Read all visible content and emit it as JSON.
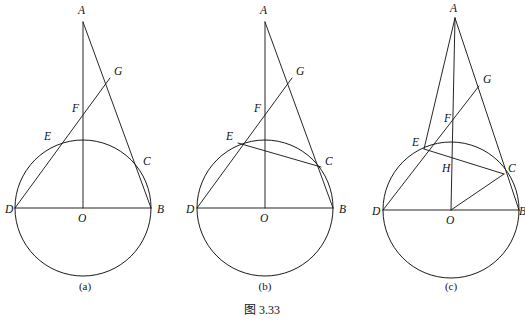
{
  "figure": {
    "caption": "图 3.33",
    "caption_x": 262,
    "caption_y": 314,
    "background_color": "#ffffff",
    "ink_color": "#1b1b1b"
  },
  "panels": [
    {
      "id": "panel-a",
      "caption": "(a)",
      "caption_x": 85,
      "caption_y": 290,
      "circle": {
        "cx": 83,
        "cy": 208,
        "r": 68
      },
      "points": [
        {
          "name": "A",
          "x": 83,
          "y": 22,
          "label_x": 78,
          "label_y": 14
        },
        {
          "name": "G",
          "x": 110,
          "y": 78,
          "label_x": 114,
          "label_y": 75
        },
        {
          "name": "F",
          "x": 83,
          "y": 112,
          "label_x": 72,
          "label_y": 112
        },
        {
          "name": "E",
          "x": 56,
          "y": 143,
          "label_x": 44,
          "label_y": 140
        },
        {
          "name": "C",
          "x": 139,
          "y": 167,
          "label_x": 143,
          "label_y": 165
        },
        {
          "name": "D",
          "x": 15,
          "y": 208,
          "label_x": 5,
          "label_y": 213
        },
        {
          "name": "O",
          "x": 83,
          "y": 208,
          "label_x": 78,
          "label_y": 222
        },
        {
          "name": "B",
          "x": 151,
          "y": 208,
          "label_x": 157,
          "label_y": 213
        }
      ],
      "segments": [
        {
          "name": "segment-AO",
          "from": "A",
          "to": "O"
        },
        {
          "name": "segment-AB-through-C",
          "from": "A",
          "to": "B"
        },
        {
          "name": "segment-DG",
          "from": "D",
          "to": "G"
        },
        {
          "name": "segment-DB",
          "from": "D",
          "to": "B"
        }
      ]
    },
    {
      "id": "panel-b",
      "caption": "(b)",
      "caption_x": 265,
      "caption_y": 290,
      "circle": {
        "cx": 265,
        "cy": 208,
        "r": 68
      },
      "points": [
        {
          "name": "A",
          "x": 265,
          "y": 22,
          "label_x": 260,
          "label_y": 14
        },
        {
          "name": "G",
          "x": 292,
          "y": 78,
          "label_x": 296,
          "label_y": 75
        },
        {
          "name": "F",
          "x": 265,
          "y": 112,
          "label_x": 254,
          "label_y": 112
        },
        {
          "name": "E",
          "x": 238,
          "y": 143,
          "label_x": 226,
          "label_y": 140
        },
        {
          "name": "C",
          "x": 321,
          "y": 167,
          "label_x": 325,
          "label_y": 165
        },
        {
          "name": "D",
          "x": 197,
          "y": 208,
          "label_x": 186,
          "label_y": 213
        },
        {
          "name": "O",
          "x": 265,
          "y": 208,
          "label_x": 260,
          "label_y": 222
        },
        {
          "name": "B",
          "x": 333,
          "y": 208,
          "label_x": 339,
          "label_y": 213
        }
      ],
      "segments": [
        {
          "name": "segment-AO",
          "from": "A",
          "to": "O"
        },
        {
          "name": "segment-AB-through-C",
          "from": "A",
          "to": "B"
        },
        {
          "name": "segment-DG",
          "from": "D",
          "to": "G"
        },
        {
          "name": "segment-DB",
          "from": "D",
          "to": "B"
        },
        {
          "name": "chord-EC",
          "from": "E",
          "to": "C"
        }
      ]
    },
    {
      "id": "panel-c",
      "caption": "(c)",
      "caption_x": 451,
      "caption_y": 290,
      "circle": {
        "cx": 451,
        "cy": 210,
        "r": 68
      },
      "points": [
        {
          "name": "A",
          "x": 455,
          "y": 18,
          "label_x": 450,
          "label_y": 12
        },
        {
          "name": "G",
          "x": 479,
          "y": 86,
          "label_x": 483,
          "label_y": 83
        },
        {
          "name": "F",
          "x": 455,
          "y": 122,
          "label_x": 444,
          "label_y": 122
        },
        {
          "name": "E",
          "x": 424,
          "y": 149,
          "label_x": 412,
          "label_y": 146
        },
        {
          "name": "H",
          "x": 455,
          "y": 161,
          "label_x": 442,
          "label_y": 172
        },
        {
          "name": "C",
          "x": 504,
          "y": 174,
          "label_x": 508,
          "label_y": 172
        },
        {
          "name": "D",
          "x": 383,
          "y": 210,
          "label_x": 372,
          "label_y": 215
        },
        {
          "name": "O",
          "x": 451,
          "y": 210,
          "label_x": 446,
          "label_y": 224
        },
        {
          "name": "B",
          "x": 519,
          "y": 210,
          "label_x": 519,
          "label_y": 215
        }
      ],
      "segments": [
        {
          "name": "segment-AO",
          "from": "A",
          "to": "O"
        },
        {
          "name": "segment-AB-through-C",
          "from": "A",
          "to": "B"
        },
        {
          "name": "segment-AE",
          "from": "A",
          "to": "E"
        },
        {
          "name": "segment-DG",
          "from": "D",
          "to": "G"
        },
        {
          "name": "segment-DB",
          "from": "D",
          "to": "B"
        },
        {
          "name": "chord-EC",
          "from": "E",
          "to": "C"
        },
        {
          "name": "radius-OC",
          "from": "O",
          "to": "C"
        }
      ]
    }
  ]
}
